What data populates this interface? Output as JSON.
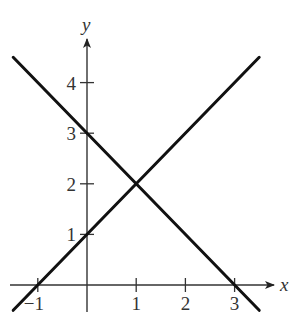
{
  "chart_data": {
    "type": "line",
    "title": "",
    "xlabel": "x",
    "ylabel": "y",
    "xlim": [
      -1.5,
      3.8
    ],
    "ylim": [
      -0.5,
      4.8
    ],
    "grid": false,
    "legend": null,
    "x_ticks": [
      {
        "value": -1,
        "label": "−1"
      },
      {
        "value": 1,
        "label": "1"
      },
      {
        "value": 2,
        "label": "2"
      },
      {
        "value": 3,
        "label": "3"
      }
    ],
    "y_ticks": [
      {
        "value": 1,
        "label": "1"
      },
      {
        "value": 2,
        "label": "2"
      },
      {
        "value": 3,
        "label": "3"
      },
      {
        "value": 4,
        "label": "4"
      }
    ],
    "series": [
      {
        "name": "line-increasing",
        "equation": "y = x + 1",
        "x": [
          -1.5,
          3.5
        ],
        "y": [
          -0.5,
          4.5
        ]
      },
      {
        "name": "line-decreasing",
        "equation": "y = -x + 3",
        "x": [
          -1.5,
          3.5
        ],
        "y": [
          4.5,
          -0.5
        ]
      }
    ],
    "intersection": {
      "x": 1,
      "y": 2
    },
    "intercepts": {
      "line-increasing": {
        "x_intercept": -1,
        "y_intercept": 1
      },
      "line-decreasing": {
        "x_intercept": 3,
        "y_intercept": 3
      }
    }
  }
}
